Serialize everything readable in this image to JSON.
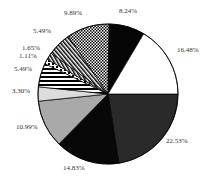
{
  "chart_data": {
    "type": "pie",
    "title": "",
    "start_angle_deg": 0,
    "direction": "clockwise",
    "slices": [
      {
        "label": "22.53%",
        "value": 22.53,
        "fill": "dark-gray",
        "color": "#2a2a2a"
      },
      {
        "label": "14.83%",
        "value": 14.83,
        "fill": "black",
        "color": "#080808"
      },
      {
        "label": "10.99%",
        "value": 10.99,
        "fill": "gray",
        "color": "#a9a9a9"
      },
      {
        "label": "3.30%",
        "value": 3.3,
        "fill": "light-gray",
        "color": "#dcdcdc"
      },
      {
        "label": "5.49%",
        "value": 5.49,
        "fill": "horizontal-stripes",
        "color": "#000000"
      },
      {
        "label": "1.11%",
        "value": 1.11,
        "fill": "dots",
        "color": "#000000"
      },
      {
        "label": "1.65%",
        "value": 1.65,
        "fill": "diagonal-hatch",
        "color": "#000000"
      },
      {
        "label": "5.49%",
        "value": 5.49,
        "fill": "diagonal-stripes",
        "color": "#000000"
      },
      {
        "label": "9.89%",
        "value": 9.89,
        "fill": "checkerboard",
        "color": "#000000"
      },
      {
        "label": "8.24%",
        "value": 8.24,
        "fill": "black",
        "color": "#050505"
      },
      {
        "label": "16.48%",
        "value": 16.48,
        "fill": "white",
        "color": "#ffffff"
      }
    ],
    "legend": null,
    "grid": false
  },
  "labels": [
    {
      "text": "22.53%",
      "x": 166,
      "y": 141
    },
    {
      "text": "14.83%",
      "x": 63,
      "y": 168
    },
    {
      "text": "10.99%",
      "x": 16,
      "y": 127
    },
    {
      "text": "3.30%",
      "x": 12,
      "y": 91
    },
    {
      "text": "5.49%",
      "x": 14,
      "y": 69
    },
    {
      "text": "1.11%",
      "x": 19,
      "y": 56
    },
    {
      "text": "1.65%",
      "x": 22,
      "y": 48
    },
    {
      "text": "5.49%",
      "x": 33,
      "y": 31
    },
    {
      "text": "9.89%",
      "x": 64,
      "y": 13
    },
    {
      "text": "8.24%",
      "x": 119,
      "y": 11
    },
    {
      "text": "16.48%",
      "x": 177,
      "y": 50
    }
  ]
}
